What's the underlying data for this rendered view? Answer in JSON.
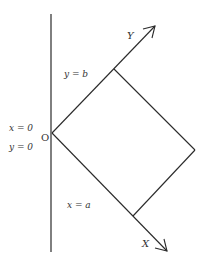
{
  "diagram": {
    "colors": {
      "stroke": "#2a2a2a",
      "text": "#333333",
      "background": "#ffffff"
    },
    "labels": {
      "origin": "O",
      "x_axis": "X",
      "y_axis": "Y",
      "line_y_b": "y = b",
      "line_x_a": "x = a",
      "origin_x": "x = 0",
      "origin_y": "y = 0"
    },
    "points": {
      "origin": [
        52,
        133
      ],
      "rect_top": [
        114,
        69
      ],
      "rect_right": [
        195,
        150
      ],
      "rect_bottom": [
        133,
        216
      ],
      "y_arrow_tip": [
        155,
        26
      ],
      "x_arrow_tip": [
        167,
        251
      ]
    },
    "vertical_wall": {
      "x": 51,
      "y_start": 14,
      "y_end": 252
    }
  }
}
